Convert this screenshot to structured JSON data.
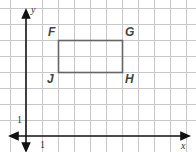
{
  "grid": {
    "origin_px": [
      26,
      136
    ],
    "unit_px": 16,
    "x_lines": [
      10,
      26,
      42,
      58,
      74,
      90,
      106,
      122,
      138,
      154,
      170,
      186
    ],
    "y_lines": [
      8,
      24,
      40,
      56,
      72,
      88,
      104,
      120,
      136,
      152
    ],
    "grid_color": "#c8c8c8",
    "axis_color": "#111111"
  },
  "axes": {
    "x_label": "x",
    "y_label": "y",
    "x_tick_label": "1",
    "y_tick_label": "1"
  },
  "rectangle": {
    "color": "#666666",
    "vertices": [
      {
        "name": "F",
        "x": 2,
        "y": 6
      },
      {
        "name": "G",
        "x": 6,
        "y": 6
      },
      {
        "name": "H",
        "x": 6,
        "y": 4
      },
      {
        "name": "J",
        "x": 2,
        "y": 4
      }
    ]
  },
  "labels": {
    "F": "F",
    "G": "G",
    "H": "H",
    "J": "J"
  }
}
